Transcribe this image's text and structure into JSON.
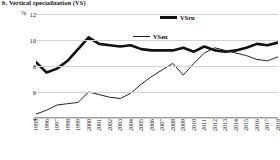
{
  "caption": "b. Vertical specialization (VS)",
  "axes": {
    "y_unit": "%",
    "y_ticks": [
      12,
      10,
      8,
      6,
      4
    ],
    "x_ticks": [
      "1995",
      "1996",
      "1997",
      "1998",
      "1999",
      "2000",
      "2001",
      "2002",
      "2003",
      "2004",
      "2005",
      "2006",
      "2007",
      "2008",
      "2009",
      "2010",
      "2011",
      "2012",
      "2013",
      "2014",
      "2015",
      "2016",
      "2017",
      "2018"
    ]
  },
  "legend": [
    {
      "label": "VSru",
      "style": "thick",
      "color": "#111111"
    },
    {
      "label": "VSeu",
      "style": "thin",
      "color": "#222222"
    }
  ],
  "chart_data": {
    "type": "line",
    "title": "b. Vertical specialization (VS)",
    "xlabel": "",
    "ylabel": "%",
    "ylim": [
      4,
      12
    ],
    "grid": true,
    "legend_position": "top-center",
    "x": [
      "1995",
      "1996",
      "1997",
      "1998",
      "1999",
      "2000",
      "2001",
      "2002",
      "2003",
      "2004",
      "2005",
      "2006",
      "2007",
      "2008",
      "2009",
      "2010",
      "2011",
      "2012",
      "2013",
      "2014",
      "2015",
      "2016",
      "2017",
      "2018"
    ],
    "series": [
      {
        "name": "VSru",
        "values": [
          8.3,
          7.5,
          7.8,
          8.4,
          9.3,
          10.2,
          9.7,
          9.6,
          9.5,
          9.6,
          9.3,
          9.2,
          9.2,
          9.2,
          9.4,
          9.1,
          9.5,
          9.2,
          9.1,
          9.2,
          9.4,
          9.7,
          9.6,
          9.8
        ]
      },
      {
        "name": "VSeu",
        "values": [
          4.3,
          4.6,
          5.0,
          5.1,
          5.2,
          6.0,
          5.8,
          5.6,
          5.5,
          5.9,
          6.6,
          7.2,
          7.7,
          8.2,
          7.3,
          8.2,
          9.0,
          9.4,
          9.2,
          9.0,
          8.8,
          8.5,
          8.4,
          8.7
        ]
      }
    ]
  }
}
